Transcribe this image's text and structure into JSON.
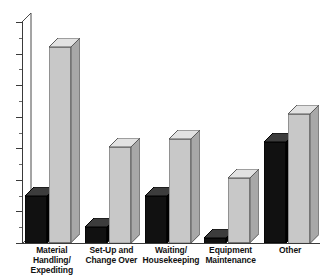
{
  "chart_data": {
    "type": "bar",
    "title": "",
    "subtitle": "",
    "xlabel": "",
    "ylabel": "",
    "ylim": [
      0,
      14
    ],
    "yticks": [
      0,
      2,
      4,
      6,
      8,
      10,
      12,
      14
    ],
    "ytick_labels": [
      "0",
      "2",
      "4",
      "6",
      "8",
      "10",
      "12",
      "14"
    ],
    "minor_tick_step": 1,
    "grid": false,
    "legend": false,
    "legend_position": "none",
    "style": "3d-column",
    "categories": [
      "Material Handling/ Expediting",
      "Set-Up and Change Over",
      "Waiting/ Housekeeping",
      "Equipment Maintenance",
      "Other"
    ],
    "category_lines": [
      [
        "Material",
        "Handling/",
        "Expediting"
      ],
      [
        "Set-Up and",
        "Change Over"
      ],
      [
        "Waiting/",
        "Housekeeping"
      ],
      [
        "Equipment",
        "Maintenance"
      ],
      [
        "Other"
      ]
    ],
    "series": [
      {
        "name": "Series 1",
        "color": "#111111",
        "values": [
          3.0,
          1.0,
          3.0,
          0.3,
          6.4
        ]
      },
      {
        "name": "Series 2",
        "color": "#c8c8c8",
        "values": [
          12.4,
          6.1,
          6.6,
          4.1,
          8.2
        ]
      }
    ]
  },
  "colors": {
    "series_dark": "#111111",
    "series_light": "#c8c8c8",
    "series_light_top": "#e2e2e2",
    "series_light_side": "#a8a8a8",
    "series_dark_top": "#3c3c3c",
    "series_dark_side": "#000000",
    "axis": "#3a3a3a",
    "background": "#ffffff",
    "text": "#111111"
  }
}
